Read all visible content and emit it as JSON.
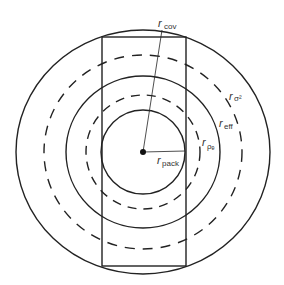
{
  "diagram": {
    "colors": {
      "stroke": "#222222",
      "text": "#333333",
      "background": "#ffffff"
    },
    "center": {
      "x": 143,
      "y": 152
    },
    "circles": [
      {
        "name": "outer-solid",
        "rx": 127,
        "ry": 122,
        "style": "solid"
      },
      {
        "name": "outer-dashed",
        "rx": 103,
        "ry": 100,
        "style": "dashed"
      },
      {
        "name": "middle-solid",
        "rx": 77,
        "ry": 76,
        "style": "solid"
      },
      {
        "name": "inner-dashed",
        "rx": 57,
        "ry": 57,
        "style": "dashed"
      },
      {
        "name": "inner-solid",
        "rx": 42,
        "ry": 42,
        "style": "solid"
      }
    ],
    "rectangle": {
      "x": 102,
      "y": 37,
      "width": 84,
      "height": 229
    },
    "labels": {
      "r_cov": {
        "main": "r",
        "sub": "cov"
      },
      "r_sigma2": {
        "main": "r",
        "sub": "σ²"
      },
      "r_eff": {
        "main": "r",
        "sub": "eff"
      },
      "r_rho": {
        "main": "r",
        "sub": "ρₑ"
      },
      "r_pack": {
        "main": "r",
        "sub": "pack"
      }
    }
  }
}
